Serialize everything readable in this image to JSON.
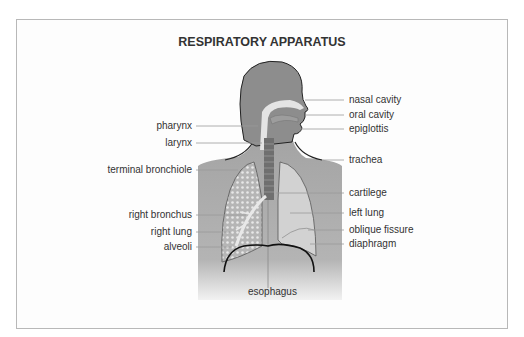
{
  "title": "RESPIRATORY APPARATUS",
  "labels": {
    "left": [
      {
        "id": "pharynx",
        "text": "pharynx"
      },
      {
        "id": "larynx",
        "text": "larynx"
      },
      {
        "id": "terminal-bronchiole",
        "text": "terminal bronchiole"
      },
      {
        "id": "right-bronchus",
        "text": "right bronchus"
      },
      {
        "id": "right-lung",
        "text": "right lung"
      },
      {
        "id": "alveoli",
        "text": "alveoli"
      }
    ],
    "right": [
      {
        "id": "nasal-cavity",
        "text": "nasal cavity"
      },
      {
        "id": "oral-cavity",
        "text": "oral cavity"
      },
      {
        "id": "epiglottis",
        "text": "epiglottis"
      },
      {
        "id": "trachea",
        "text": "trachea"
      },
      {
        "id": "cartilege",
        "text": "cartilege"
      },
      {
        "id": "left-lung",
        "text": "left lung"
      },
      {
        "id": "oblique-fissure",
        "text": "oblique fissure"
      },
      {
        "id": "diaphragm",
        "text": "diaphragm"
      }
    ],
    "bottom": {
      "id": "esophagus",
      "text": "esophagus"
    }
  },
  "colors": {
    "body": "#8a8a8a",
    "torso": "#a9a9a9",
    "lung": "#d2d2d2",
    "airway": "#e0e0e0",
    "outline": "#222222",
    "leader": "#999999",
    "text": "#333333"
  }
}
